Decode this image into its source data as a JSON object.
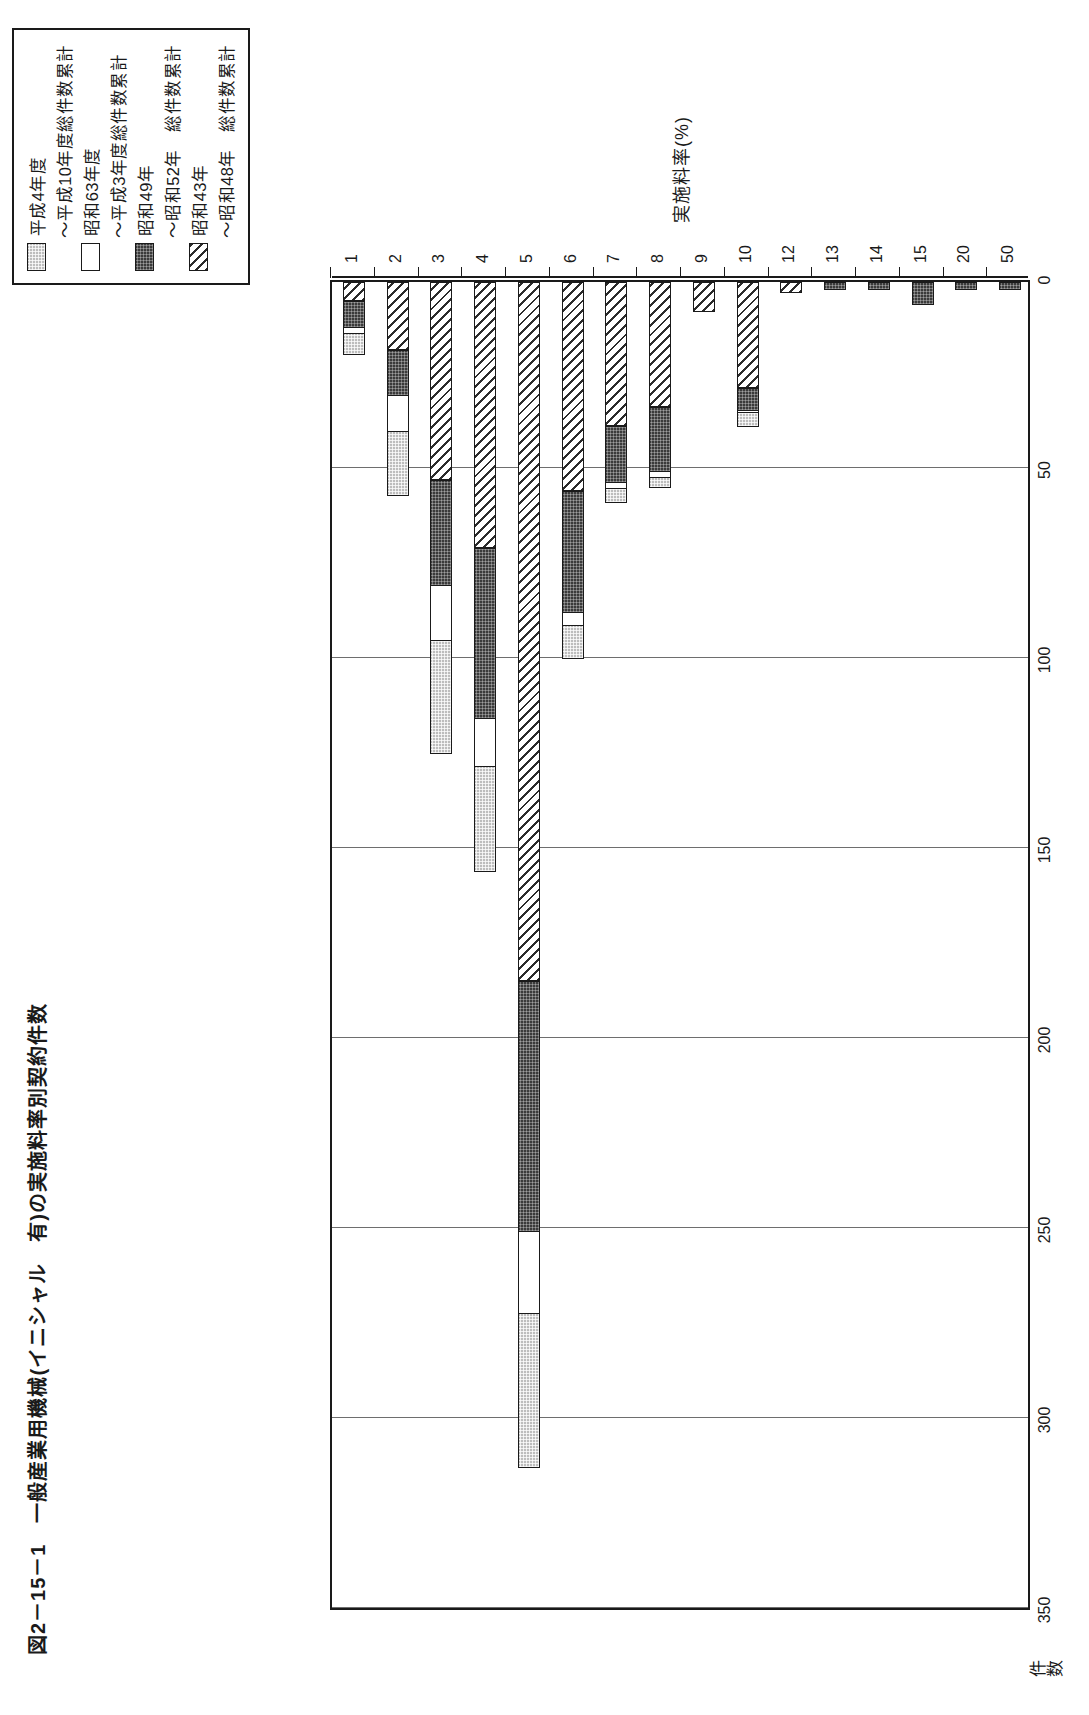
{
  "figure": {
    "title": "図2－15－1　一般産業用機械(イニシャル　有)の実施料率別契約件数"
  },
  "legend": {
    "items": [
      {
        "swatch": "light-grid",
        "label": "平成4年度"
      },
      {
        "swatch": "none",
        "label": "～平成10年度総件数累計"
      },
      {
        "swatch": "white",
        "label": "昭和63年度"
      },
      {
        "swatch": "none",
        "label": "～平成3年度総件数累計"
      },
      {
        "swatch": "dark",
        "label": "昭和49年"
      },
      {
        "swatch": "none",
        "label": "～昭和52年　総件数累計"
      },
      {
        "swatch": "hatch",
        "label": "昭和43年"
      },
      {
        "swatch": "none",
        "label": "～昭和48年　総件数累計"
      }
    ]
  },
  "chart_data": {
    "type": "bar",
    "orientation": "vertical-rotated",
    "title": "図2－15－1　一般産業用機械(イニシャル　有)の実施料率別契約件数",
    "xlabel": "実施料率(%)",
    "ylabel": "件数",
    "ylim": [
      0,
      350
    ],
    "yticks": [
      350,
      300,
      250,
      200,
      150,
      100,
      50,
      0
    ],
    "grid": true,
    "legend_position": "top-right",
    "categories": [
      "1",
      "2",
      "3",
      "4",
      "5",
      "6",
      "7",
      "8",
      "9",
      "10",
      "12",
      "13",
      "14",
      "15",
      "20",
      "50"
    ],
    "series": [
      {
        "name": "昭和43年～昭和48年　総件数累計",
        "pattern": "hatch",
        "values": [
          5,
          18,
          52,
          70,
          184,
          55,
          38,
          33,
          8,
          28,
          3,
          0,
          0,
          0,
          0,
          0
        ]
      },
      {
        "name": "昭和49年～昭和52年　総件数累計",
        "pattern": "dark",
        "values": [
          7,
          12,
          28,
          45,
          66,
          32,
          15,
          17,
          0,
          6,
          0,
          2,
          2,
          6,
          2,
          2
        ]
      },
      {
        "name": "昭和63年度～平成3年度総件数累計",
        "pattern": "white",
        "values": [
          2,
          10,
          15,
          13,
          22,
          4,
          2,
          2,
          0,
          1,
          0,
          0,
          0,
          0,
          0,
          0
        ]
      },
      {
        "name": "平成4年度～平成10年度総件数累計",
        "pattern": "light-grid",
        "values": [
          6,
          17,
          30,
          28,
          41,
          9,
          4,
          3,
          0,
          4,
          0,
          0,
          0,
          0,
          0,
          0
        ]
      }
    ],
    "totals": [
      20,
      57,
      125,
      156,
      313,
      100,
      59,
      55,
      8,
      39,
      3,
      2,
      2,
      6,
      2,
      2
    ]
  }
}
